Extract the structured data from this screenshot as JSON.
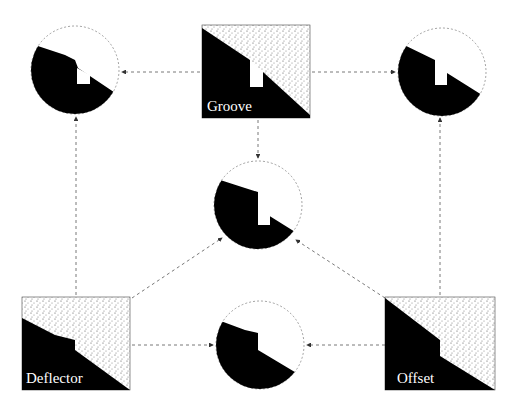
{
  "diagram": {
    "nodes": [
      {
        "id": "groove",
        "type": "config",
        "label": "Groove"
      },
      {
        "id": "deflector",
        "type": "config",
        "label": "Deflector"
      },
      {
        "id": "offset",
        "type": "config",
        "label": "Offset"
      },
      {
        "id": "groove-deflector",
        "type": "result"
      },
      {
        "id": "groove-offset",
        "type": "result"
      },
      {
        "id": "all-combined",
        "type": "result"
      },
      {
        "id": "deflector-offset",
        "type": "result"
      }
    ],
    "edges": [
      {
        "from": "groove",
        "to": "groove-deflector"
      },
      {
        "from": "groove",
        "to": "groove-offset"
      },
      {
        "from": "groove",
        "to": "all-combined"
      },
      {
        "from": "deflector",
        "to": "groove-deflector"
      },
      {
        "from": "deflector",
        "to": "all-combined"
      },
      {
        "from": "deflector",
        "to": "deflector-offset"
      },
      {
        "from": "offset",
        "to": "groove-offset"
      },
      {
        "from": "offset",
        "to": "all-combined"
      },
      {
        "from": "offset",
        "to": "deflector-offset"
      }
    ]
  }
}
